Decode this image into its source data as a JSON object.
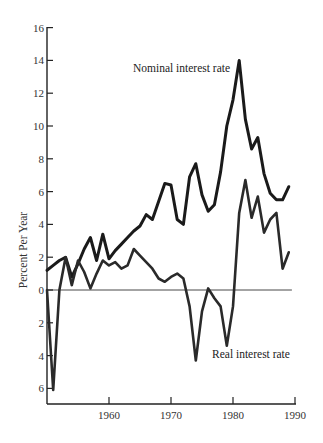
{
  "chart_data": {
    "type": "line",
    "title": "",
    "xlabel": "",
    "ylabel": "Percent Per Year",
    "xlim": [
      1950,
      1990
    ],
    "ylim": [
      -7,
      16
    ],
    "x_ticks": [
      1960,
      1970,
      1980,
      1990
    ],
    "y_ticks": [
      16,
      14,
      12,
      10,
      8,
      6,
      4,
      2,
      0,
      -2,
      -4,
      -6
    ],
    "y_tick_labels": [
      "16",
      "14",
      "12",
      "10",
      "8",
      "6",
      "4",
      "2",
      "0",
      "2",
      "4",
      "6"
    ],
    "grid": false,
    "reference_line": {
      "y": 0,
      "x_from": 1950,
      "x_to": 1989.5
    },
    "legend_position": "inline labels",
    "series": [
      {
        "name": "Nominal interest rate",
        "x": [
          1950,
          1951,
          1952,
          1953,
          1954,
          1955,
          1956,
          1957,
          1958,
          1959,
          1960,
          1961,
          1962,
          1963,
          1964,
          1965,
          1966,
          1967,
          1968,
          1969,
          1970,
          1971,
          1972,
          1973,
          1974,
          1975,
          1976,
          1977,
          1978,
          1979,
          1980,
          1981,
          1982,
          1983,
          1984,
          1985,
          1986,
          1987,
          1988,
          1989
        ],
        "values": [
          1.2,
          1.5,
          1.8,
          2.0,
          0.8,
          1.6,
          2.5,
          3.2,
          1.8,
          3.4,
          1.9,
          2.4,
          2.8,
          3.2,
          3.6,
          3.9,
          4.6,
          4.3,
          5.4,
          6.5,
          6.4,
          4.3,
          4.0,
          6.9,
          7.7,
          5.8,
          4.8,
          5.2,
          7.2,
          10.0,
          11.6,
          14.0,
          10.4,
          8.6,
          9.3,
          7.1,
          5.9,
          5.5,
          5.5,
          6.3
        ]
      },
      {
        "name": "Real interest rate",
        "x": [
          1950,
          1951,
          1952,
          1953,
          1954,
          1955,
          1956,
          1957,
          1958,
          1959,
          1960,
          1961,
          1962,
          1963,
          1964,
          1965,
          1966,
          1967,
          1968,
          1969,
          1970,
          1971,
          1972,
          1973,
          1974,
          1975,
          1976,
          1977,
          1978,
          1979,
          1980,
          1981,
          1982,
          1983,
          1984,
          1985,
          1986,
          1987,
          1988,
          1989
        ],
        "values": [
          0.0,
          -6.1,
          0.0,
          2.0,
          0.3,
          1.8,
          1.1,
          0.1,
          1.0,
          1.8,
          1.5,
          1.7,
          1.3,
          1.5,
          2.5,
          2.1,
          1.7,
          1.3,
          0.7,
          0.5,
          0.8,
          1.0,
          0.7,
          -1.0,
          -4.3,
          -1.3,
          0.1,
          -0.5,
          -1.0,
          -3.4,
          -1.0,
          4.7,
          6.7,
          4.4,
          5.7,
          3.5,
          4.3,
          4.7,
          1.3,
          2.3
        ]
      }
    ],
    "annotations": [
      {
        "text": "Nominal interest rate",
        "near": [
          1977.5,
          14.0
        ]
      },
      {
        "text": "Real interest rate",
        "near": [
          1984,
          -4.3
        ]
      }
    ]
  },
  "labels": {
    "ylabel": "Percent Per Year",
    "nominal": "Nominal interest rate",
    "real": "Real interest rate"
  }
}
